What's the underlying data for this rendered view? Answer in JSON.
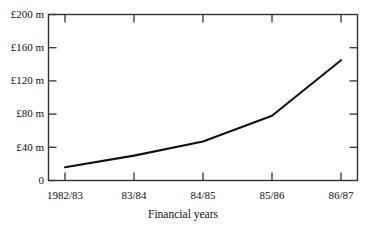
{
  "chart_data": {
    "type": "line",
    "title": "",
    "xlabel": "Financial years",
    "ylabel": "",
    "categories": [
      "1982/83",
      "83/84",
      "84/85",
      "85/86",
      "86/87"
    ],
    "values": [
      16,
      30,
      47,
      78,
      145
    ],
    "unit": "£ m",
    "ylim": [
      0,
      200
    ],
    "ytick_values": [
      0,
      40,
      80,
      120,
      160,
      200
    ],
    "ytick_labels": [
      "0",
      "£40 m",
      "£80 m",
      "£120 m",
      "£160 m",
      "£200 m"
    ],
    "grid": false,
    "legend": false,
    "series": [
      {
        "name": "",
        "values": [
          16,
          30,
          47,
          78,
          145
        ]
      }
    ],
    "line_color": "#111111",
    "frame_color": "#333333",
    "background_color": "#ffffff"
  },
  "axes": {
    "y_labels": [
      {
        "text": "£200 m",
        "value": 200
      },
      {
        "text": "£160 m",
        "value": 160
      },
      {
        "text": "£120 m",
        "value": 120
      },
      {
        "text": "£80 m",
        "value": 80
      },
      {
        "text": "£40 m",
        "value": 40
      },
      {
        "text": "0",
        "value": 0
      }
    ],
    "x_labels": [
      {
        "text": "1982/83",
        "value": 0
      },
      {
        "text": "83/84",
        "value": 1
      },
      {
        "text": "84/85",
        "value": 2
      },
      {
        "text": "85/86",
        "value": 3
      },
      {
        "text": "86/87",
        "value": 4
      }
    ],
    "x_title": "Financial years"
  }
}
